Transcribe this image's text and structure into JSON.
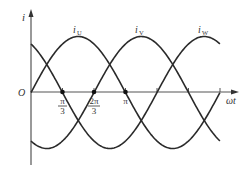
{
  "figure": {
    "y_axis_label": "i",
    "x_axis_label": "ωt",
    "origin_label": "O",
    "tick_labels": [
      {
        "num": "π",
        "den": "3"
      },
      {
        "num": "2π",
        "den": "3"
      },
      {
        "single": "π"
      }
    ],
    "curve_labels": [
      "i",
      "i",
      "i"
    ],
    "curve_subscripts": [
      "U",
      "V",
      "W"
    ],
    "colors": {
      "line": "#2a2a2a",
      "axis": "#555555",
      "text": "#333333"
    }
  },
  "chart_data": {
    "type": "line",
    "title": "",
    "xlabel": "ωt",
    "ylabel": "i",
    "x_range": [
      0,
      6.283
    ],
    "xticks": [
      "π/3",
      "2π/3",
      "π",
      "4π/3",
      "5π/3",
      "2π"
    ],
    "xtick_labels_shown": [
      "π/3",
      "2π/3",
      "π"
    ],
    "marked_points": [
      {
        "x": "π/3",
        "y": 0,
        "curve": "iW"
      },
      {
        "x": "2π/3",
        "y": 0,
        "curve": "iV"
      },
      {
        "x": "π",
        "y": 0,
        "curve": "iU"
      }
    ],
    "series": [
      {
        "name": "iU",
        "formula": "Im·sin(ωt)",
        "phase_deg": 0
      },
      {
        "name": "iV",
        "formula": "Im·sin(ωt − 2π/3)",
        "phase_deg": -120
      },
      {
        "name": "iW",
        "formula": "Im·sin(ωt + 2π/3)",
        "phase_deg": 120
      }
    ],
    "grid": false,
    "legend": "inline labels above peaks"
  }
}
